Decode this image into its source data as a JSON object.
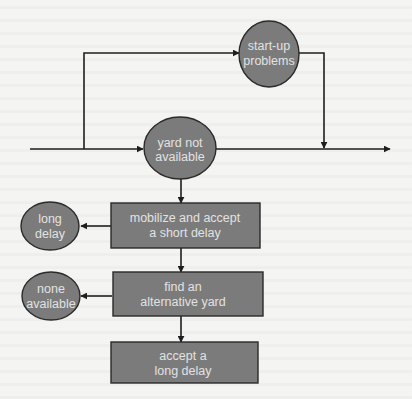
{
  "diagram": {
    "type": "flowchart",
    "colors": {
      "background": "#f4f4f2",
      "node_fill": "#7b7b7b",
      "node_stroke": "#2a2a2a",
      "node_text": "#e2e2e2",
      "edge": "#1e1e1e"
    },
    "nodes": {
      "startup_problems": {
        "shape": "ellipse",
        "line1": "start-up",
        "line2": "problems"
      },
      "yard_not_available": {
        "shape": "ellipse",
        "line1": "yard not",
        "line2": "available"
      },
      "mobilize": {
        "shape": "rectangle",
        "line1": "mobilize and accept",
        "line2": "a short delay"
      },
      "long_delay": {
        "shape": "ellipse",
        "line1": "long",
        "line2": "delay"
      },
      "find_alternative": {
        "shape": "rectangle",
        "line1": "find an",
        "line2": "alternative yard"
      },
      "none_available": {
        "shape": "ellipse",
        "line1": "none",
        "line2": "available"
      },
      "accept_long_delay": {
        "shape": "rectangle",
        "line1": "accept a",
        "line2": "long delay"
      }
    },
    "edges": [
      {
        "from": "input",
        "to": "yard_not_available"
      },
      {
        "from": "input",
        "to": "startup_problems"
      },
      {
        "from": "startup_problems",
        "to": "main_line"
      },
      {
        "from": "yard_not_available",
        "to": "output"
      },
      {
        "from": "yard_not_available",
        "to": "mobilize"
      },
      {
        "from": "mobilize",
        "to": "long_delay"
      },
      {
        "from": "mobilize",
        "to": "find_alternative"
      },
      {
        "from": "find_alternative",
        "to": "none_available"
      },
      {
        "from": "find_alternative",
        "to": "accept_long_delay"
      }
    ]
  }
}
